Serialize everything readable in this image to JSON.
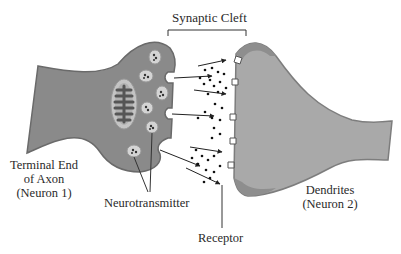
{
  "diagram": {
    "title": "Synaptic Cleft",
    "labels": {
      "synaptic_cleft": "Synaptic Cleft",
      "axon_line1": "Terminal End",
      "axon_line2": "of Axon",
      "axon_line3": "(Neuron 1)",
      "neurotransmitter": "Neurotransmitter",
      "receptor": "Receptor",
      "dendrite_line1": "Dendrites",
      "dendrite_line2": "(Neuron 2)"
    },
    "colors": {
      "neuron1_fill": "#8a8a8a",
      "neuron1_edge": "#6e6e6e",
      "neuron2_fill": "#a9a9a9",
      "neuron2_edge": "#7d7d7d",
      "vesicle_fill": "#d0d0d0",
      "dot": "#1a1a1a",
      "line": "#333333"
    },
    "components": [
      "axon terminal",
      "mitochondrion",
      "vesicles",
      "synaptic cleft",
      "neurotransmitter molecules",
      "receptors",
      "dendrite"
    ]
  }
}
